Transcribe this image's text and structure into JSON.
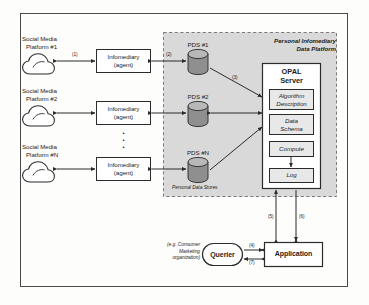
{
  "diagram": {
    "outer_frame": "outer-border",
    "platform_box": {
      "label_line1": "Personal Infomediary",
      "label_line2": "Data Platform",
      "sublabel": "Personal Data Stores"
    },
    "social_platforms": [
      {
        "line1": "Social Media",
        "line2": "Platform #1",
        "icon": "cloud-icon"
      },
      {
        "line1": "Social Media",
        "line2": "Platform #2",
        "icon": "cloud-icon"
      },
      {
        "line1": "Social Media",
        "line2": "Platform #N",
        "icon": "cloud-icon"
      }
    ],
    "infomediaries": [
      {
        "line1": "Infomediary",
        "line2": "(agent)"
      },
      {
        "line1": "Infomediary",
        "line2": "(agent)"
      },
      {
        "line1": "Infomediary",
        "line2": "(agent)"
      }
    ],
    "vertical_ellipsis": "•",
    "pds": [
      {
        "label": "PDS #1",
        "icon": "database-cylinder-icon"
      },
      {
        "label": "PDS #2",
        "icon": "database-cylinder-icon"
      },
      {
        "label": "PDS #N",
        "icon": "database-cylinder-icon"
      }
    ],
    "opal_server": {
      "title_line1": "OPAL",
      "title_line2": "Server",
      "modules": [
        {
          "line1": "Algorithm",
          "line2": "Description"
        },
        {
          "line1": "Data",
          "line2": "Schema"
        },
        {
          "line1": "Compute",
          "line2": ""
        },
        {
          "line1": "Log",
          "line2": ""
        }
      ]
    },
    "querier": {
      "label": "Querier",
      "note_line1": "(e.g. Consumer",
      "note_line2": "Marketing",
      "note_line3": "organization)"
    },
    "application": {
      "label": "Application"
    },
    "step_labels": [
      {
        "id": "1",
        "text": "(1)"
      },
      {
        "id": "2",
        "text": "(2)"
      },
      {
        "id": "3",
        "text": "(3)"
      },
      {
        "id": "4",
        "text": "(4)"
      },
      {
        "id": "5",
        "text": "(5)"
      },
      {
        "id": "6",
        "text": "(6)"
      },
      {
        "id": "7",
        "text": "(7)"
      }
    ],
    "colors": {
      "stroke": "#2b2b2b",
      "platform_fill": "#d9d9d9",
      "box_fill": "#ffffff",
      "cylinder_fill": "#8f8f8f",
      "module_fill": "#e8e8e8",
      "page_bg": "#fdfdfc"
    }
  }
}
